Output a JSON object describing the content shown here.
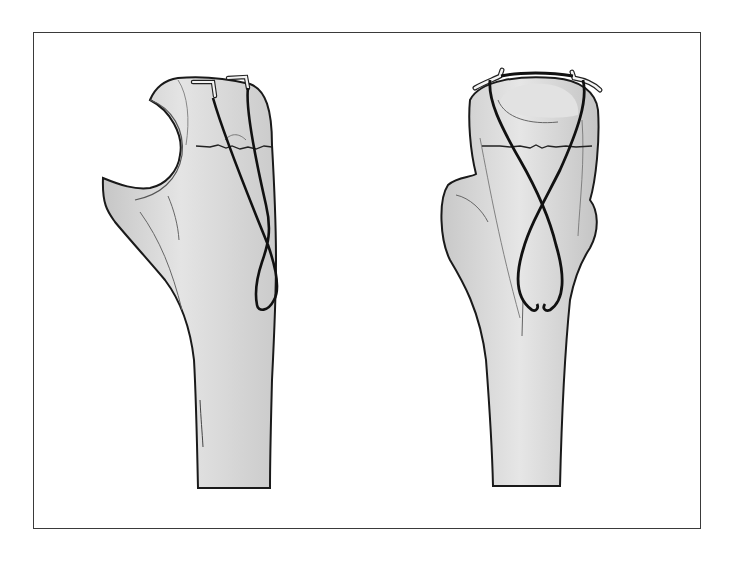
{
  "figure": {
    "panels": [
      {
        "id": "left",
        "view": "lateral",
        "features": [
          "proximal-ulna-olecranon",
          "transverse-fracture-line",
          "two-k-wires",
          "figure-of-eight-tension-band-wire"
        ]
      },
      {
        "id": "right",
        "view": "anteroposterior",
        "features": [
          "proximal-ulna",
          "transverse-fracture-line",
          "two-k-wires",
          "figure-of-eight-tension-band-wire"
        ]
      }
    ],
    "colors": {
      "bone_fill": "#d4d4d4",
      "bone_light": "#e8e8e8",
      "outline": "#1a1a1a",
      "wire": "#111111",
      "kwire": "#f4f4f4",
      "frame": "#3a3a3a"
    }
  }
}
